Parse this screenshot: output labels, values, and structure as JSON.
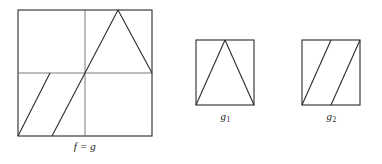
{
  "figure": {
    "stroke_color": "#2b2b2b",
    "background_color": "#ffffff",
    "panels": [
      {
        "id": "main",
        "name": "f-equals-g-panel",
        "label": "f = g",
        "label_plain": "f = g",
        "subscript": "",
        "square": {
          "x": 18,
          "y": 10,
          "width": 134,
          "height": 126
        },
        "has_midlines": true,
        "midline_vertical_x": 85,
        "midline_horizontal_y": 73,
        "graph_segments": [
          {
            "name": "sawtooth-tooth-1",
            "x1": 18,
            "y1": 136,
            "x2": 50,
            "y2": 73
          },
          {
            "name": "sawtooth-tooth-2",
            "x1": 52,
            "y1": 136,
            "x2": 85,
            "y2": 73
          },
          {
            "name": "triangle-rising-edge",
            "x1": 85,
            "y1": 73,
            "x2": 118,
            "y2": 10
          },
          {
            "name": "triangle-falling-edge",
            "x1": 118,
            "y1": 10,
            "x2": 152,
            "y2": 73
          }
        ]
      },
      {
        "id": "g1",
        "name": "g1-panel",
        "label": "g1",
        "label_plain": "g",
        "subscript": "1",
        "square": {
          "x": 196,
          "y": 40,
          "width": 58,
          "height": 65
        },
        "has_midlines": false,
        "graph_segments": [
          {
            "name": "triangle-rising-edge",
            "x1": 196,
            "y1": 105,
            "x2": 225,
            "y2": 40
          },
          {
            "name": "triangle-falling-edge",
            "x1": 225,
            "y1": 40,
            "x2": 254,
            "y2": 105
          }
        ]
      },
      {
        "id": "g2",
        "name": "g2-panel",
        "label": "g2",
        "label_plain": "g",
        "subscript": "2",
        "square": {
          "x": 302,
          "y": 40,
          "width": 58,
          "height": 65
        },
        "has_midlines": false,
        "graph_segments": [
          {
            "name": "sawtooth-tooth-1",
            "x1": 302,
            "y1": 105,
            "x2": 331,
            "y2": 40
          },
          {
            "name": "sawtooth-tooth-2",
            "x1": 331,
            "y1": 105,
            "x2": 360,
            "y2": 40
          }
        ]
      }
    ]
  },
  "chart_data": {
    "type": "line",
    "title": "",
    "xlabel": "",
    "ylabel": "",
    "xlim": [
      0,
      1
    ],
    "ylim": [
      0,
      1
    ],
    "grid": false,
    "legend": "none",
    "annotations": [
      "f = g",
      "g1",
      "g2"
    ],
    "series": [
      {
        "name": "f = g",
        "panel": "main",
        "shape": "two-period sawtooth on [0,0.5] then single triangle peak on [0.5,1]",
        "x": [
          0.0,
          0.24,
          0.25,
          0.5,
          0.75,
          1.0
        ],
        "y": [
          0.0,
          0.5,
          0.0,
          0.5,
          1.0,
          0.5
        ]
      },
      {
        "name": "g1",
        "panel": "g1",
        "shape": "single symmetric triangle peak",
        "x": [
          0.0,
          0.5,
          1.0
        ],
        "y": [
          0.0,
          1.0,
          0.0
        ]
      },
      {
        "name": "g2",
        "panel": "g2",
        "shape": "two-period sawtooth",
        "x": [
          0.0,
          0.5,
          0.5,
          1.0
        ],
        "y": [
          0.0,
          1.0,
          0.0,
          1.0
        ]
      }
    ]
  }
}
